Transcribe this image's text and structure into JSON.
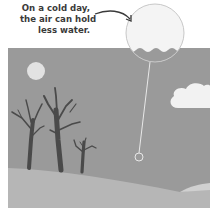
{
  "caption": {
    "lines": [
      "On a cold day,",
      "the air can hold",
      "less water."
    ]
  },
  "scene": {
    "sky_color": "#9a9a9a",
    "ground_color": "#b6b6b6",
    "sun_color": "#e2e2e2",
    "cloud_color": "#f2f2f2",
    "tree_color": "#4a4a4a",
    "zoom_bubble_fill": "#f4f4f4",
    "water_color": "#9a9a9a"
  }
}
